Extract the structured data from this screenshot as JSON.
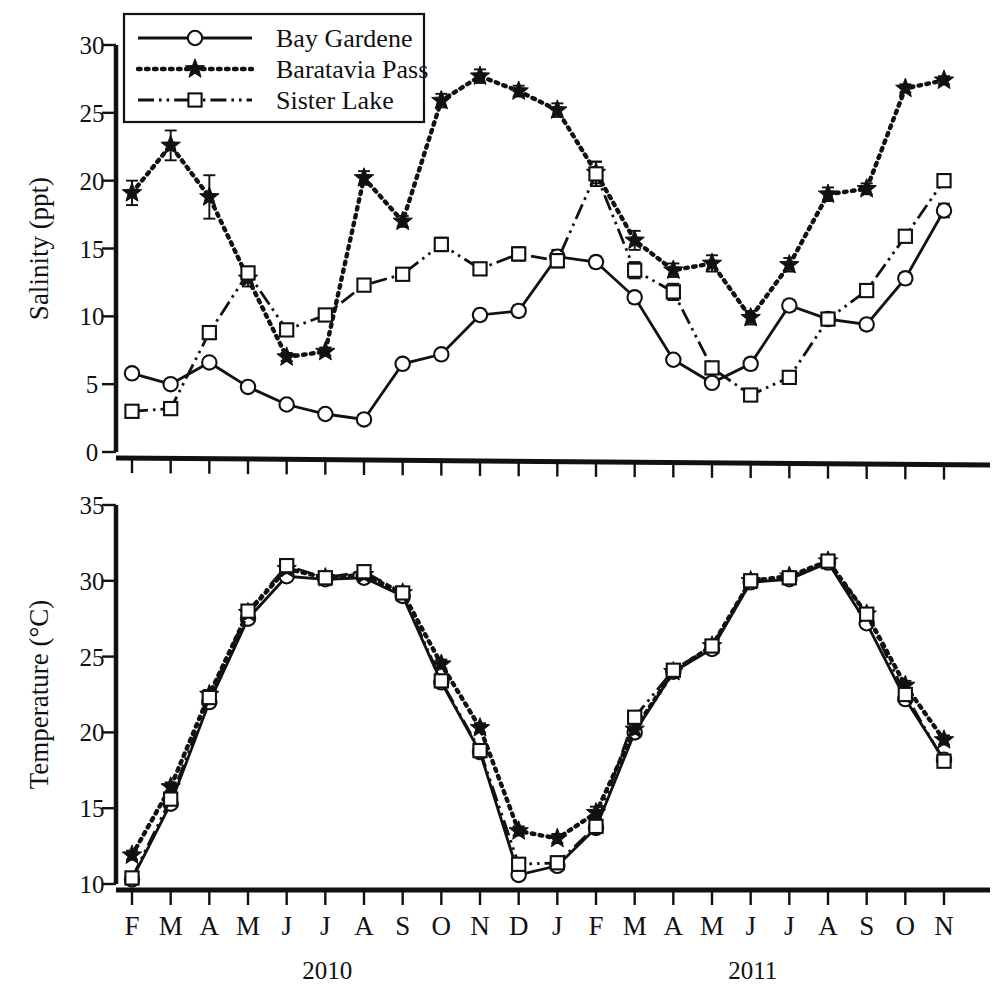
{
  "figure": {
    "legend": {
      "position": "top-left",
      "entries": [
        {
          "label": "Bay Gardene",
          "style": "solid",
          "marker": "circle"
        },
        {
          "label": "Baratavia Pass",
          "style": "dotted",
          "marker": "star"
        },
        {
          "label": "Sister Lake",
          "style": "dash-dot",
          "marker": "square"
        }
      ]
    },
    "year_labels": [
      {
        "text": "2010",
        "at_index": 5
      },
      {
        "text": "2011",
        "at_index": 16
      }
    ],
    "ink_color": "#111111",
    "panel_background": "#ffffff"
  },
  "chart_data": [
    {
      "type": "line",
      "panel": "top",
      "title": "",
      "xlabel": "",
      "ylabel": "Salinity (ppt)",
      "ylim": [
        0,
        30
      ],
      "yticks": [
        0,
        5,
        10,
        15,
        20,
        25,
        30
      ],
      "grid": false,
      "legend": "top-left",
      "x": [
        "F",
        "M",
        "A",
        "M",
        "J",
        "J",
        "A",
        "S",
        "O",
        "N",
        "D",
        "J",
        "F",
        "M",
        "A",
        "M",
        "J",
        "J",
        "A",
        "S",
        "O",
        "N"
      ],
      "series": [
        {
          "name": "Bay Gardene",
          "marker": "circle",
          "linestyle": "solid",
          "values": [
            5.8,
            5.0,
            6.6,
            4.8,
            3.5,
            2.8,
            2.4,
            6.5,
            7.2,
            10.1,
            10.4,
            14.4,
            14.0,
            11.4,
            6.8,
            5.1,
            6.5,
            10.8,
            9.8,
            9.4,
            12.8,
            17.8
          ],
          "errors": [
            0.3,
            0.3,
            0.3,
            0.3,
            0.3,
            0.3,
            0.3,
            0.3,
            0.3,
            0.4,
            0.4,
            0.5,
            0.4,
            0.4,
            0.3,
            0.3,
            0.4,
            0.4,
            0.4,
            0.4,
            0.4,
            0.5
          ]
        },
        {
          "name": "Baratavia Pass",
          "marker": "star",
          "linestyle": "dotted",
          "values": [
            19.1,
            22.6,
            18.8,
            12.8,
            7.0,
            7.4,
            20.2,
            17.0,
            25.9,
            27.7,
            26.6,
            25.2,
            20.6,
            15.6,
            13.4,
            13.9,
            9.9,
            13.8,
            19.0,
            19.4,
            26.8,
            27.4
          ],
          "errors": [
            0.9,
            1.1,
            1.6,
            0.6,
            0.3,
            0.3,
            0.5,
            0.4,
            0.5,
            0.5,
            0.4,
            0.5,
            0.8,
            0.7,
            0.5,
            0.6,
            0.5,
            0.5,
            0.5,
            0.4,
            0.3,
            0.3
          ]
        },
        {
          "name": "Sister Lake",
          "marker": "square",
          "linestyle": "dash-dot",
          "values": [
            3.0,
            3.2,
            8.8,
            13.2,
            9.0,
            10.1,
            12.3,
            13.1,
            15.3,
            13.5,
            14.6,
            14.1,
            20.5,
            13.4,
            11.8,
            6.2,
            4.2,
            5.5,
            9.8,
            11.9,
            15.9,
            20.0
          ],
          "errors": [
            0.3,
            0.3,
            0.4,
            0.4,
            0.3,
            0.3,
            0.3,
            0.3,
            0.5,
            0.4,
            0.5,
            0.5,
            0.9,
            0.6,
            0.6,
            0.4,
            0.3,
            0.3,
            0.4,
            0.4,
            0.4,
            0.4
          ]
        }
      ]
    },
    {
      "type": "line",
      "panel": "bottom",
      "title": "",
      "xlabel": "",
      "ylabel": "Temperature (°C)",
      "ylim": [
        10,
        35
      ],
      "yticks": [
        10,
        15,
        20,
        25,
        30,
        35
      ],
      "grid": false,
      "legend": "none",
      "x": [
        "F",
        "M",
        "A",
        "M",
        "J",
        "J",
        "A",
        "S",
        "O",
        "N",
        "D",
        "J",
        "F",
        "M",
        "A",
        "M",
        "J",
        "J",
        "A",
        "S",
        "O",
        "N"
      ],
      "series": [
        {
          "name": "Bay Gardene",
          "marker": "circle",
          "linestyle": "solid",
          "values": [
            10.3,
            15.3,
            22.0,
            27.5,
            30.3,
            30.1,
            30.2,
            29.0,
            23.3,
            18.7,
            10.6,
            11.2,
            13.7,
            20.0,
            24.0,
            25.5,
            29.9,
            30.1,
            31.2,
            27.2,
            22.2,
            18.2
          ],
          "errors": [
            0.3,
            0.3,
            0.3,
            0.3,
            0.3,
            0.3,
            0.3,
            0.3,
            0.3,
            0.3,
            0.3,
            0.3,
            0.3,
            0.3,
            0.3,
            0.3,
            0.3,
            0.3,
            0.3,
            0.3,
            0.3,
            0.3
          ]
        },
        {
          "name": "Baratavia Pass",
          "marker": "star",
          "linestyle": "dotted",
          "values": [
            11.9,
            16.4,
            22.5,
            27.9,
            30.8,
            30.2,
            30.4,
            29.2,
            24.5,
            20.3,
            13.5,
            13.0,
            14.7,
            20.2,
            24.0,
            25.7,
            30.0,
            30.3,
            31.3,
            27.8,
            23.1,
            19.5
          ],
          "errors": [
            0.3,
            0.3,
            0.3,
            0.3,
            0.3,
            0.3,
            0.3,
            0.3,
            0.3,
            0.3,
            0.3,
            0.3,
            0.4,
            0.3,
            0.3,
            0.3,
            0.3,
            0.3,
            0.3,
            0.3,
            0.3,
            0.3
          ]
        },
        {
          "name": "Sister Lake",
          "marker": "square",
          "linestyle": "dash-dot",
          "values": [
            10.4,
            15.6,
            22.3,
            28.0,
            31.0,
            30.2,
            30.6,
            29.2,
            23.4,
            18.8,
            11.3,
            11.4,
            13.8,
            21.0,
            24.1,
            25.7,
            30.0,
            30.2,
            31.3,
            27.8,
            22.5,
            18.1
          ],
          "errors": [
            0.3,
            0.3,
            0.3,
            0.3,
            0.3,
            0.3,
            0.3,
            0.3,
            0.3,
            0.3,
            0.4,
            0.4,
            0.4,
            0.4,
            0.3,
            0.3,
            0.3,
            0.3,
            0.3,
            0.3,
            0.3,
            0.3
          ]
        }
      ]
    }
  ]
}
